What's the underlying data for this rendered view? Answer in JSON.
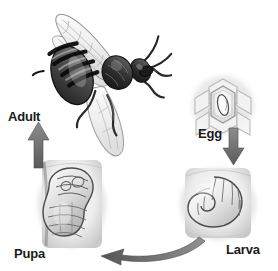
{
  "figure": {
    "style": "grayscale pencil illustration",
    "background_color": "#ffffff",
    "label_color": "#1a1a1a",
    "arrow_color": "#6e6e6e"
  },
  "stages": [
    {
      "id": "adult",
      "label": "Adult",
      "illustration": "adult-honey-bee-icon",
      "position": "top-left"
    },
    {
      "id": "egg",
      "label": "Egg",
      "illustration": "egg-in-honeycomb-cell-icon",
      "position": "right-upper"
    },
    {
      "id": "larva",
      "label": "Larva",
      "illustration": "c-shaped-larva-in-cell-icon",
      "position": "bottom-right"
    },
    {
      "id": "pupa",
      "label": "Pupa",
      "illustration": "pupa-in-cell-icon",
      "position": "bottom-left"
    }
  ],
  "arrows": [
    {
      "id": "egg-to-larva",
      "from": "egg",
      "to": "larva",
      "shape": "straight-down-arrow-icon"
    },
    {
      "id": "larva-to-pupa",
      "from": "larva",
      "to": "pupa",
      "shape": "curved-left-arrow-icon"
    },
    {
      "id": "pupa-to-adult",
      "from": "pupa",
      "to": "adult",
      "shape": "straight-up-arrow-icon"
    }
  ]
}
